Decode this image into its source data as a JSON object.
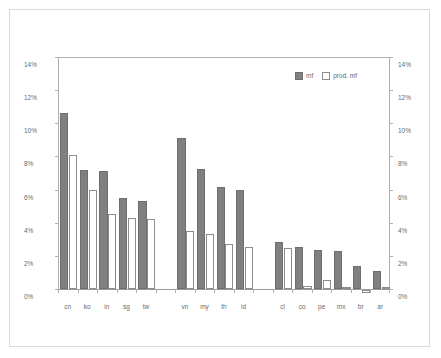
{
  "chart_data": {
    "type": "bar",
    "title": "",
    "subtitle": "",
    "xlabel": "",
    "ylabel": "",
    "ylim": [
      0,
      14
    ],
    "y_unit": "%",
    "grid": false,
    "legend_position": "top-right",
    "dual_axis": true,
    "axis_tick_labels": [
      "0%",
      "2%",
      "4%",
      "6%",
      "8%",
      "10%",
      "12%",
      "14%"
    ],
    "axis_tick_values": [
      0,
      2,
      4,
      6,
      8,
      10,
      12,
      14
    ],
    "categories": [
      "cn",
      "ko",
      "in",
      "sg",
      "tw",
      "vn",
      "my",
      "th",
      "id",
      "cl",
      "co",
      "pe",
      "mx",
      "br",
      "ar"
    ],
    "group_breaks_after": [
      "tw",
      "id"
    ],
    "series": [
      {
        "name": "mf",
        "color": "#808080",
        "values": [
          10.6,
          7.2,
          7.1,
          5.5,
          5.3,
          9.1,
          7.25,
          6.15,
          5.95,
          2.85,
          2.55,
          2.35,
          2.3,
          1.4,
          1.1
        ]
      },
      {
        "name": "prod. mf",
        "color": "#ffffff",
        "values": [
          8.1,
          6.0,
          4.5,
          4.3,
          4.2,
          3.5,
          3.35,
          2.7,
          2.55,
          2.45,
          0.2,
          0.55,
          0.1,
          -0.2,
          0.15
        ]
      }
    ]
  },
  "legend": {
    "items": [
      {
        "label": "mf",
        "swatch": "filled-square-icon"
      },
      {
        "label": "prod. mf",
        "swatch": "outlined-square-icon"
      }
    ]
  },
  "colors": {
    "series_mf": "#808080",
    "series_prod_mf": "#ffffff",
    "axis": "#b0b0b0",
    "text": "#6b6b6b",
    "frame": "#d9d9d9",
    "background": "#ffffff"
  }
}
